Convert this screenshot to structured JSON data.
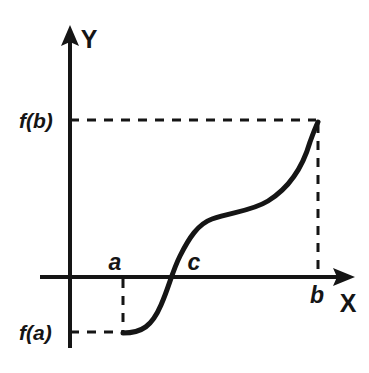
{
  "figure": {
    "kind": "math-graph",
    "background_color": "#ffffff",
    "stroke_color": "#151515"
  },
  "axes": {
    "x_axis_label": "X",
    "y_axis_label": "Y",
    "x_axis_y_pixel": 277,
    "y_axis_x_pixel": 70,
    "x_axis_start_px": 40,
    "x_axis_end_px": 355,
    "y_axis_top_px": 25,
    "y_axis_bottom_px": 348,
    "arrow_style": "solid-triangle"
  },
  "labels": {
    "f_of_b": "f(b)",
    "f_of_a": "f(a)",
    "point_a": "a",
    "point_c": "c",
    "point_b": "b"
  },
  "chart_data": {
    "type": "line",
    "title": "",
    "xlabel": "X",
    "ylabel": "Y",
    "grid": false,
    "legend": "none",
    "annotations": [
      {
        "name": "a",
        "text": "a",
        "x_px": 123,
        "y_px": 262,
        "meaning": "left endpoint of interval on X axis"
      },
      {
        "name": "c",
        "text": "c",
        "x_px": 194,
        "y_px": 262,
        "meaning": "root where f(c) = 0"
      },
      {
        "name": "b",
        "text": "b",
        "x_px": 318,
        "y_px": 296,
        "meaning": "right endpoint of interval on X axis"
      },
      {
        "name": "f(a)",
        "text": "f(a)",
        "x_px": 42,
        "y_px": 332,
        "meaning": "negative function value at a"
      },
      {
        "name": "f(b)",
        "text": "f(b)",
        "x_px": 42,
        "y_px": 120,
        "meaning": "positive function value at b"
      }
    ],
    "x_tick_labels": [
      "a",
      "c",
      "b"
    ],
    "y_tick_labels": [
      "f(a)",
      "f(b)"
    ],
    "points_px": [
      {
        "label": "(a, f(a))",
        "x": 123,
        "y": 333
      },
      {
        "label": "(c, 0)",
        "x": 169,
        "y": 277
      },
      {
        "label": "(b, f(b))",
        "x": 318,
        "y": 122
      }
    ],
    "curve_path_px": "M 123 333 C 142 333 152 326 161 305 C 169 287 172 272 180 256 C 189 238 198 224 212 219 C 232 212 252 211 268 201 C 289 188 303 166 310 142 C 314 131 316 126 318 122",
    "dashed_guides": [
      {
        "name": "f(b)-horizontal",
        "from_px": [
          70,
          120
        ],
        "to_px": [
          318,
          120
        ]
      },
      {
        "name": "b-vertical",
        "from_px": [
          318,
          124
        ],
        "to_px": [
          318,
          277
        ]
      },
      {
        "name": "a-vertical",
        "from_px": [
          123,
          277
        ],
        "to_px": [
          123,
          333
        ]
      },
      {
        "name": "f(a)-horizontal",
        "from_px": [
          70,
          332
        ],
        "to_px": [
          123,
          332
        ]
      }
    ]
  }
}
